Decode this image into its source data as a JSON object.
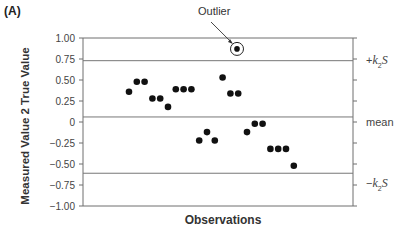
{
  "panel_label": "(A)",
  "chart_data": {
    "type": "scatter",
    "title": "",
    "xlabel": "Observations",
    "ylabel": "Measured Value 2 True Value",
    "ylim": [
      -1.0,
      1.0
    ],
    "yticks": [
      1.0,
      0.75,
      0.5,
      0.25,
      0,
      -0.25,
      -0.5,
      -0.75,
      -1.0
    ],
    "ytick_labels": [
      "1.00",
      "0.75",
      "0.50",
      "0.25",
      "0",
      "−0.25",
      "−0.50",
      "−0.75",
      "−1.00"
    ],
    "grid": false,
    "series": [
      {
        "name": "Observations",
        "x": [
          1,
          2,
          3,
          4,
          5,
          6,
          7,
          8,
          9,
          10,
          11,
          12,
          13,
          14,
          15,
          16,
          17,
          18,
          19,
          20,
          21,
          22
        ],
        "values": [
          0.36,
          0.48,
          0.48,
          0.28,
          0.28,
          0.18,
          0.39,
          0.39,
          0.39,
          -0.22,
          -0.12,
          -0.22,
          0.53,
          0.34,
          0.34,
          -0.12,
          -0.02,
          -0.02,
          -0.32,
          -0.32,
          -0.32,
          -0.52
        ]
      },
      {
        "name": "Outlier",
        "x": [
          15.2
        ],
        "values": [
          0.87
        ]
      }
    ],
    "reference_lines": [
      {
        "name": "+k2S",
        "label": "+k₂S",
        "value": 0.73
      },
      {
        "name": "mean",
        "label": "mean",
        "value": 0.06
      },
      {
        "name": "-k2S",
        "label": "−k₂S",
        "value": -0.61
      }
    ],
    "annotations": [
      {
        "text": "Outlier",
        "target_value": 0.87
      }
    ]
  },
  "labels": {
    "outlier": "Outlier",
    "mean": "mean",
    "upper_sign": "+",
    "lower_sign": "−",
    "k": "k",
    "sub": "2",
    "s": "S"
  }
}
